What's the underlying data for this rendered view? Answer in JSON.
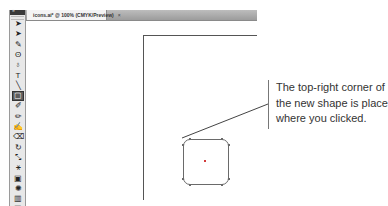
{
  "document_tab": {
    "title": "icons.ai* @ 100% (CMYK/Preview)",
    "close_glyph": "×"
  },
  "toolbar": {
    "header_glyph": "»",
    "tools": [
      {
        "name": "selection-tool-icon",
        "glyph": "➤",
        "active": false
      },
      {
        "name": "direct-selection-tool-icon",
        "glyph": "➤",
        "active": false
      },
      {
        "name": "magic-wand-tool-icon",
        "glyph": "✎",
        "active": false
      },
      {
        "name": "lasso-tool-icon",
        "glyph": "ʘ",
        "active": false
      },
      {
        "name": "pen-tool-icon",
        "glyph": "♁",
        "active": false
      },
      {
        "name": "type-tool-icon",
        "glyph": "T",
        "active": false
      },
      {
        "name": "line-segment-tool-icon",
        "glyph": "╲",
        "active": false
      },
      {
        "name": "rectangle-tool-icon",
        "glyph": "▢",
        "active": true
      },
      {
        "name": "paintbrush-tool-icon",
        "glyph": "✐",
        "active": false
      },
      {
        "name": "pencil-tool-icon",
        "glyph": "✏",
        "active": false
      },
      {
        "name": "blob-brush-tool-icon",
        "glyph": "✍",
        "active": false
      },
      {
        "name": "eraser-tool-icon",
        "glyph": "⌫",
        "active": false
      },
      {
        "name": "rotate-tool-icon",
        "glyph": "↻",
        "active": false
      },
      {
        "name": "scale-tool-icon",
        "glyph": "⤡",
        "active": false
      },
      {
        "name": "shape-builder-tool-icon",
        "glyph": "⚹",
        "active": false
      },
      {
        "name": "free-transform-tool-icon",
        "glyph": "▣",
        "active": false
      },
      {
        "name": "symbol-sprayer-tool-icon",
        "glyph": "✺",
        "active": false
      },
      {
        "name": "column-graph-tool-icon",
        "glyph": "▥",
        "active": false
      },
      {
        "name": "artboard-tool-icon",
        "glyph": "▤",
        "active": false
      }
    ]
  },
  "callout": {
    "lines": [
      "The top-right corner of",
      "the new shape is placed",
      "where you clicked."
    ]
  },
  "colors": {
    "canvas": "#ffffff",
    "toolbar_bg": "#e8e8e8",
    "toolbar_header": "#3a3a3a",
    "tabbar": "#a8a8a8",
    "artboard_edge": "#555555",
    "shape_stroke": "#6a6a6a",
    "callout_text": "#333333"
  }
}
